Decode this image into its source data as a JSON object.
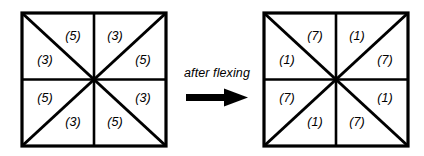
{
  "diagram": {
    "type": "geometric-diagram",
    "background_color": "#ffffff",
    "line_color": "#000000",
    "transition": {
      "label": "after flexing",
      "arrow_icon": "right-arrow-icon",
      "direction": "right"
    },
    "figures": [
      {
        "id": "before",
        "name": "left-square",
        "shape": "square",
        "subdivision": "8 triangles (vertical + horizontal midlines, both diagonals)",
        "values": [
          "5",
          "3",
          "3",
          "5",
          "5",
          "3",
          "3",
          "5"
        ],
        "cells": [
          {
            "position": "top-left-upper",
            "label": "(5)"
          },
          {
            "position": "top-right-upper",
            "label": "(3)"
          },
          {
            "position": "left-upper",
            "label": "(3)"
          },
          {
            "position": "right-upper",
            "label": "(5)"
          },
          {
            "position": "left-lower",
            "label": "(5)"
          },
          {
            "position": "right-lower",
            "label": "(3)"
          },
          {
            "position": "bottom-left-lower",
            "label": "(3)"
          },
          {
            "position": "bottom-right-lower",
            "label": "(5)"
          }
        ]
      },
      {
        "id": "after",
        "name": "right-square",
        "shape": "square",
        "subdivision": "8 triangles (vertical + horizontal midlines, both diagonals)",
        "values": [
          "7",
          "1",
          "1",
          "7",
          "7",
          "1",
          "1",
          "7"
        ],
        "cells": [
          {
            "position": "top-left-upper",
            "label": "(7)"
          },
          {
            "position": "top-right-upper",
            "label": "(1)"
          },
          {
            "position": "left-upper",
            "label": "(1)"
          },
          {
            "position": "right-upper",
            "label": "(7)"
          },
          {
            "position": "left-lower",
            "label": "(7)"
          },
          {
            "position": "right-lower",
            "label": "(1)"
          },
          {
            "position": "bottom-left-lower",
            "label": "(1)"
          },
          {
            "position": "bottom-right-lower",
            "label": "(7)"
          }
        ]
      }
    ]
  }
}
